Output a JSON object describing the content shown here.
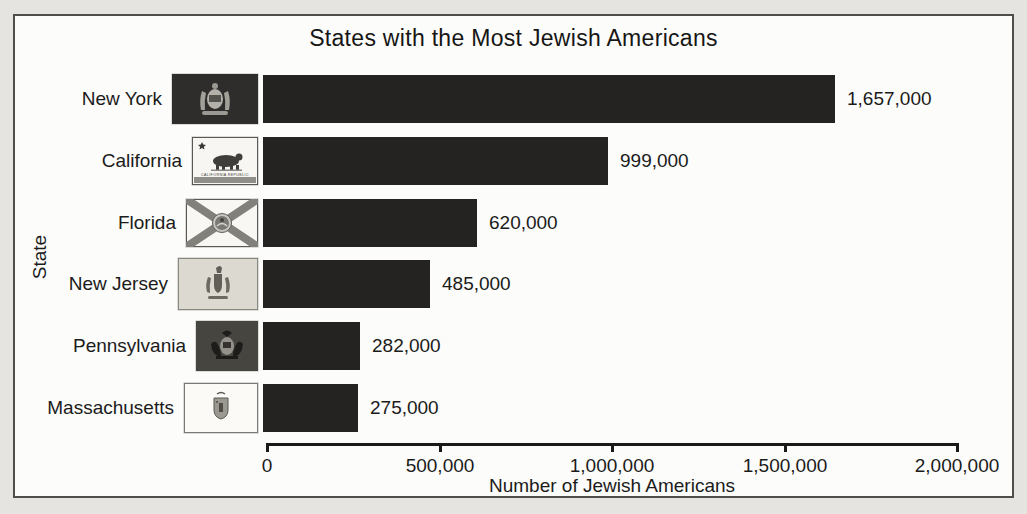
{
  "chart_data": {
    "type": "bar",
    "orientation": "horizontal",
    "title": "States with the Most Jewish Americans",
    "xlabel": "Number of Jewish Americans",
    "ylabel": "State",
    "categories": [
      "New York",
      "California",
      "Florida",
      "New Jersey",
      "Pennsylvania",
      "Massachusetts"
    ],
    "values": [
      1657000,
      999000,
      620000,
      485000,
      282000,
      275000
    ],
    "value_labels": [
      "1,657,000",
      "999,000",
      "620,000",
      "485,000",
      "282,000",
      "275,000"
    ],
    "x_ticks": [
      0,
      500000,
      1000000,
      1500000,
      2000000
    ],
    "x_tick_labels": [
      "0",
      "500,000",
      "1,000,000",
      "1,500,000",
      "2,000,000"
    ],
    "xlim": [
      0,
      2000000
    ],
    "grid": false,
    "legend": false,
    "bar_color": "#242321",
    "flags": [
      "new-york-flag",
      "california-flag",
      "florida-flag",
      "new-jersey-flag",
      "pennsylvania-flag",
      "massachusetts-flag"
    ],
    "california_flag_text": "CALIFORNIA REPUBLIC"
  },
  "colors": {
    "page_background": "#e6e4e0",
    "panel_background": "#fcfcfa",
    "frame_border": "#504e4a",
    "bar": "#242321",
    "text": "#1b1b1a"
  }
}
